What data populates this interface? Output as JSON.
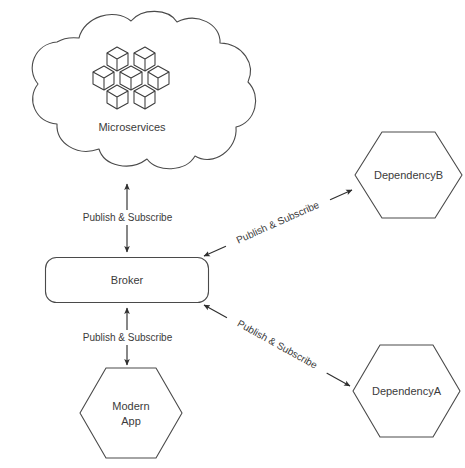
{
  "diagram": {
    "type": "architecture-diagram",
    "background_color": "#ffffff",
    "stroke_color": "#4a4a4a",
    "text_color": "#3b3b3b",
    "nodes": [
      {
        "id": "microservices",
        "label": "Microservices",
        "shape": "cloud",
        "icon": "cubes-cluster-icon",
        "icon_count": 7
      },
      {
        "id": "broker",
        "label": "Broker",
        "shape": "rounded-rectangle"
      },
      {
        "id": "modern-app",
        "label_line1": "Modern",
        "label_line2": "App",
        "shape": "hexagon"
      },
      {
        "id": "dependency-b",
        "label": "DependencyB",
        "shape": "hexagon"
      },
      {
        "id": "dependency-a",
        "label": "DependencyA",
        "shape": "hexagon"
      }
    ],
    "edges": [
      {
        "id": "broker-microservices",
        "label": "Publish & Subscribe",
        "from": "broker",
        "to": "microservices",
        "direction": "bidirectional",
        "orientation": "vertical"
      },
      {
        "id": "broker-modern-app",
        "label": "Publish & Subscribe",
        "from": "broker",
        "to": "modern-app",
        "direction": "bidirectional",
        "orientation": "vertical"
      },
      {
        "id": "broker-dependency-b",
        "label": "Publish & Subscribe",
        "from": "broker",
        "to": "dependency-b",
        "direction": "bidirectional",
        "orientation": "diagonal-up-right"
      },
      {
        "id": "broker-dependency-a",
        "label": "Publish & Subscribe",
        "from": "broker",
        "to": "dependency-a",
        "direction": "bidirectional",
        "orientation": "diagonal-down-right"
      }
    ]
  }
}
